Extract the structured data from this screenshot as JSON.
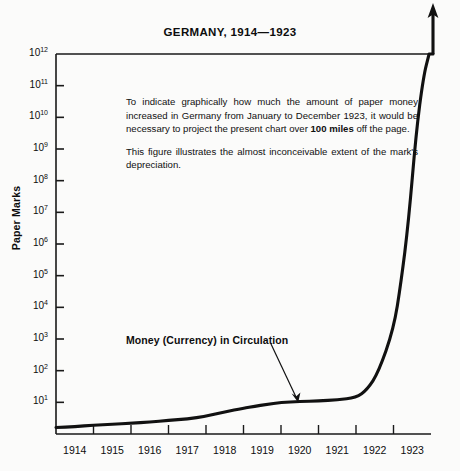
{
  "chart_data": {
    "type": "line",
    "title": "GERMANY, 1914—1923",
    "xlabel": "",
    "ylabel": "Paper Marks",
    "scale": "log",
    "grid": false,
    "legend_position": "inline-annotation",
    "xlim": [
      1914,
      1924
    ],
    "ylim": [
      1,
      1000000000000
    ],
    "x_tick_labels": [
      "1914",
      "1915",
      "1916",
      "1917",
      "1918",
      "1919",
      "1920",
      "1921",
      "1922",
      "1923"
    ],
    "y_tick_labels": [
      "10¹²",
      "10¹¹",
      "10¹⁰",
      "10⁹",
      "10⁸",
      "10⁷",
      "10⁶",
      "10⁵",
      "10⁴",
      "10³",
      "10²",
      "10¹"
    ],
    "y_tick_exponents": [
      12,
      11,
      10,
      9,
      8,
      7,
      6,
      5,
      4,
      3,
      2,
      1
    ],
    "series": [
      {
        "name": "Money (Currency) in Circulation",
        "x": [
          1914.0,
          1914.5,
          1915.0,
          1915.5,
          1916.0,
          1916.5,
          1917.0,
          1917.5,
          1918.0,
          1918.5,
          1919.0,
          1919.3,
          1919.6,
          1920.0,
          1920.5,
          1921.0,
          1921.5,
          1922.0,
          1922.3,
          1922.6,
          1923.0,
          1923.2,
          1923.4,
          1923.6,
          1923.8,
          1923.95
        ],
        "values": [
          1.6,
          1.7,
          1.9,
          2.0,
          2.2,
          2.4,
          2.7,
          3.0,
          3.6,
          5.0,
          6.5,
          7.5,
          8.5,
          10.0,
          10.5,
          11.0,
          12.0,
          14.0,
          25.0,
          90.0,
          2000.0,
          60000.0,
          5000000.0,
          3000000000.0,
          200000000000.0,
          1000000000000.0
        ]
      }
    ],
    "annotations": [
      {
        "name": "explanatory-note",
        "paragraphs": [
          {
            "segments": [
              {
                "text": "To indicate graphically how much the amount of paper money increased in Germany from January to December 1923, it would be necessary to project the present chart over ",
                "bold": false
              },
              {
                "text": "100 miles",
                "bold": true
              },
              {
                "text": " off the page.",
                "bold": false
              }
            ]
          },
          {
            "segments": [
              {
                "text": "This figure illustrates the almost inconceivable extent of the mark's depreciation.",
                "bold": false
              }
            ]
          }
        ]
      },
      {
        "name": "series-callout",
        "text": "Money (Currency) in Circulation"
      }
    ],
    "off_chart_arrow": {
      "present": true,
      "direction": "up",
      "meaning": "curve continues beyond top of chart"
    }
  },
  "colors": {
    "background": "#fbfbfa",
    "axis": "#1a1a1a",
    "series_line": "#111111",
    "text": "#0d0d0d"
  }
}
